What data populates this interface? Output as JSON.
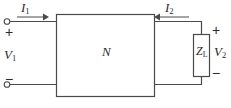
{
  "figure": {
    "stroke_color": "#4a4a4a",
    "text_color": "#2b2b2b",
    "background": "#ffffff",
    "labels": {
      "current_input": "I",
      "current_input_sub": "1",
      "current_output": "I",
      "current_output_sub": "2",
      "voltage_input": "V",
      "voltage_input_sub": "1",
      "voltage_output": "V",
      "voltage_output_sub": "2",
      "network": "N",
      "load": "Z",
      "load_sub": "L"
    },
    "polarity": {
      "input_positive": "+",
      "input_negative": "−",
      "output_positive": "+",
      "output_negative": "−"
    },
    "terminals": {
      "input_top": "input-terminal-top",
      "input_bottom": "input-terminal-bottom"
    },
    "icons": {
      "arrow_right": "arrow-right-icon",
      "arrow_left": "arrow-left-icon",
      "terminal": "terminal-circle-icon"
    }
  }
}
